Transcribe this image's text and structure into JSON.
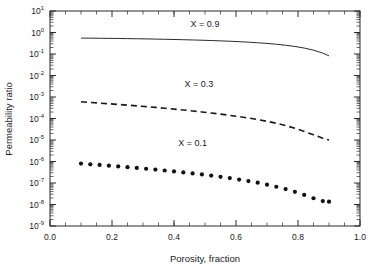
{
  "chart_data": {
    "type": "line",
    "title": "",
    "xlabel": "Porosity, fraction",
    "ylabel": "Permeability ratio",
    "xlim": [
      0.0,
      1.0
    ],
    "ylim": [
      1e-09,
      10
    ],
    "yscale": "log",
    "grid": false,
    "legend_position": "inline-annotations",
    "xticks": [
      "0.0",
      "0.2",
      "0.4",
      "0.6",
      "0.8",
      "1.0"
    ],
    "xtick_values": [
      0.0,
      0.2,
      0.4,
      0.6,
      0.8,
      1.0
    ],
    "ytick_exponents": [
      1,
      0,
      -1,
      -2,
      -3,
      -4,
      -5,
      -6,
      -7,
      -8,
      -9
    ],
    "ytick_mantissa": "10",
    "x": [
      0.1,
      0.13,
      0.16,
      0.19,
      0.22,
      0.25,
      0.28,
      0.31,
      0.34,
      0.37,
      0.4,
      0.43,
      0.46,
      0.49,
      0.52,
      0.55,
      0.58,
      0.61,
      0.64,
      0.67,
      0.7,
      0.73,
      0.76,
      0.79,
      0.82,
      0.85,
      0.88,
      0.9
    ],
    "series": [
      {
        "name": "X = 0.9",
        "style": "solid",
        "label_x": 0.5,
        "label_y": 1.9,
        "values": [
          0.55,
          0.545,
          0.54,
          0.534,
          0.527,
          0.52,
          0.512,
          0.503,
          0.494,
          0.484,
          0.473,
          0.462,
          0.45,
          0.437,
          0.423,
          0.408,
          0.392,
          0.374,
          0.355,
          0.334,
          0.311,
          0.285,
          0.256,
          0.224,
          0.189,
          0.151,
          0.11,
          0.082
        ]
      },
      {
        "name": "X = 0.3",
        "style": "dashed",
        "label_x": 0.48,
        "label_y": 0.003,
        "values": [
          0.0006,
          0.00056,
          0.00052,
          0.000485,
          0.00045,
          0.000418,
          0.000387,
          0.000357,
          0.000328,
          0.0003,
          0.000274,
          0.000249,
          0.000225,
          0.000202,
          0.00018,
          0.00016,
          0.00014,
          0.000122,
          0.000105,
          8.9e-05,
          7.4e-05,
          6e-05,
          4.7e-05,
          3.5e-05,
          2.5e-05,
          1.75e-05,
          1.2e-05,
          1e-05
        ]
      },
      {
        "name": "X = 0.1",
        "style": "dotted",
        "label_x": 0.46,
        "label_y": 5e-06,
        "values": [
          8e-07,
          7.4e-07,
          6.9e-07,
          6.4e-07,
          5.9e-07,
          5.45e-07,
          5e-07,
          4.6e-07,
          4.2e-07,
          3.82e-07,
          3.46e-07,
          3.12e-07,
          2.8e-07,
          2.5e-07,
          2.21e-07,
          1.94e-07,
          1.69e-07,
          1.45e-07,
          1.23e-07,
          1.03e-07,
          8.4e-08,
          6.7e-08,
          5.2e-08,
          3.9e-08,
          2.8e-08,
          1.95e-08,
          1.45e-08,
          1.35e-08
        ]
      }
    ]
  },
  "axes": {
    "xlabel": "Porosity, fraction",
    "ylabel": "Permeability ratio"
  }
}
